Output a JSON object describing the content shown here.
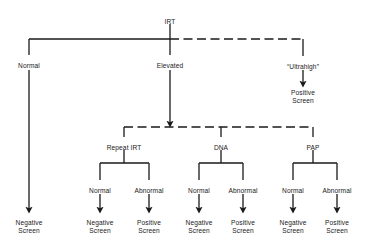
{
  "diagram": {
    "type": "flowchart",
    "background_color": "#ffffff",
    "line_color": "#1a1a1a",
    "text_color": "#1a1a1a",
    "root": {
      "id": "irt",
      "label": "IRT",
      "x": 170,
      "y": 18
    },
    "level1": [
      {
        "id": "normal-branch",
        "label": "Normal",
        "x": 29,
        "y": 62
      },
      {
        "id": "elevated-branch",
        "label": "Elevated",
        "x": 170,
        "y": 62
      },
      {
        "id": "ultrahigh-branch",
        "label": "“Ultrahigh”",
        "x": 303,
        "y": 63
      }
    ],
    "level2": [
      {
        "id": "repeat-irt",
        "label": "Repeat IRT",
        "x": 124,
        "y": 144
      },
      {
        "id": "dna",
        "label": "DNA",
        "x": 221,
        "y": 144
      },
      {
        "id": "pap",
        "label": "PAP",
        "x": 313,
        "y": 144
      }
    ],
    "level3": [
      {
        "id": "repeat-irt-normal",
        "label": "Normal",
        "x": 100,
        "y": 187
      },
      {
        "id": "repeat-irt-abnormal",
        "label": "Abnormal",
        "x": 149,
        "y": 187
      },
      {
        "id": "dna-normal",
        "label": "Normal",
        "x": 199,
        "y": 187
      },
      {
        "id": "dna-abnormal",
        "label": "Abnormal",
        "x": 243,
        "y": 187
      },
      {
        "id": "pap-normal",
        "label": "Normal",
        "x": 293,
        "y": 187
      },
      {
        "id": "pap-abnormal",
        "label": "Abnormal",
        "x": 337,
        "y": 187
      }
    ],
    "outcomes": [
      {
        "id": "ultrahigh-outcome",
        "line1": "Positive",
        "line2": "Screen",
        "x": 303,
        "y": 89
      },
      {
        "id": "normal-outcome",
        "line1": "Negative",
        "line2": "Screen",
        "x": 29,
        "y": 219
      },
      {
        "id": "repeat-irt-normal-outcome",
        "line1": "Negative",
        "line2": "Screen",
        "x": 100,
        "y": 219
      },
      {
        "id": "repeat-irt-abnormal-outcome",
        "line1": "Positive",
        "line2": "Screen",
        "x": 149,
        "y": 219
      },
      {
        "id": "dna-normal-outcome",
        "line1": "Negative",
        "line2": "Screen",
        "x": 199,
        "y": 219
      },
      {
        "id": "dna-abnormal-outcome",
        "line1": "Positive",
        "line2": "Screen",
        "x": 243,
        "y": 219
      },
      {
        "id": "pap-normal-outcome",
        "line1": "Negative",
        "line2": "Screen",
        "x": 293,
        "y": 219
      },
      {
        "id": "pap-abnormal-outcome",
        "line1": "Positive",
        "line2": "Screen",
        "x": 337,
        "y": 219
      }
    ]
  }
}
